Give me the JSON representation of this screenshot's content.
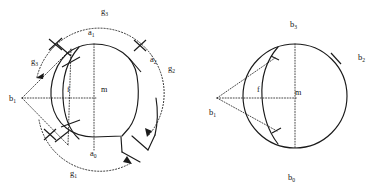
{
  "figure": {
    "background_color": "#ffffff",
    "ink_color": "#1a1a1a",
    "panels": [
      {
        "id": "left",
        "name": "cam-outline-with-tangent-construction",
        "description": "Closed rounded cam-like outline with an open notch at lower right, dotted tangent lines from apex point b1, dotted circular arcs with arrowheads, four tick marks on the outline, and a vertical chord through the centre.",
        "labels": [
          {
            "key": "g3_top",
            "base": "g",
            "sub": "3",
            "x": 101,
            "y": 14
          },
          {
            "key": "a1",
            "base": "a",
            "sub": "1",
            "x": 88,
            "y": 35
          },
          {
            "key": "a2",
            "base": "a",
            "sub": "2",
            "x": 150,
            "y": 62
          },
          {
            "key": "g2_right",
            "base": "g",
            "sub": "2",
            "x": 168,
            "y": 71
          },
          {
            "key": "g3_left",
            "base": "g",
            "sub": "3",
            "x": 31,
            "y": 64
          },
          {
            "key": "b1",
            "base": "b",
            "sub": "1",
            "x": 9,
            "y": 101
          },
          {
            "key": "a0",
            "base": "a",
            "sub": "0",
            "x": 90,
            "y": 156
          },
          {
            "key": "g1_bottom",
            "base": "g",
            "sub": "1",
            "x": 70,
            "y": 176
          }
        ],
        "plain_labels": [
          {
            "key": "f",
            "text": "f",
            "x": 67,
            "y": 92
          },
          {
            "key": "m",
            "text": "m",
            "x": 101,
            "y": 92
          }
        ]
      },
      {
        "id": "right",
        "name": "circle-with-tangent-cone-construction",
        "description": "Plain circle with centre m, inner arc f, vertical diameter between b3 and b0, a tick mark at b2 on the upper right, and two dotted tangent lines converging to the apex point b1 on the left.",
        "labels": [
          {
            "key": "b3",
            "base": "b",
            "sub": "3",
            "x": 101,
            "y": 27
          },
          {
            "key": "b2",
            "base": "b",
            "sub": "2",
            "x": 169,
            "y": 60
          },
          {
            "key": "b1",
            "base": "b",
            "sub": "1",
            "x": 20,
            "y": 115
          },
          {
            "key": "b0",
            "base": "b",
            "sub": "0",
            "x": 99,
            "y": 180
          }
        ],
        "plain_labels": [
          {
            "key": "f",
            "text": "f",
            "x": 68,
            "y": 92
          },
          {
            "key": "m",
            "text": "m",
            "x": 106,
            "y": 95
          }
        ]
      }
    ]
  }
}
